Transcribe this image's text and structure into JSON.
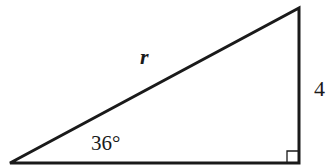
{
  "diagram": {
    "type": "right-triangle",
    "hypotenuse_label": "r",
    "opposite_side_label": "4",
    "angle_label": "36°",
    "right_angle_marker": true,
    "stroke_color": "#1a1a1a",
    "background": "#ffffff"
  }
}
